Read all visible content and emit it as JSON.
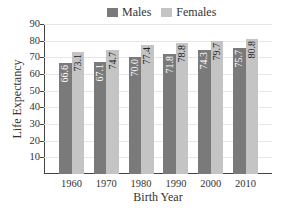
{
  "chart_data": {
    "type": "bar",
    "title": "",
    "xlabel": "Birth Year",
    "ylabel": "Life Expectancy",
    "categories": [
      "1960",
      "1970",
      "1980",
      "1990",
      "2000",
      "2010"
    ],
    "series": [
      {
        "name": "Males",
        "color": "#7a7a7a",
        "values": [
          66.6,
          67.1,
          70.0,
          71.8,
          74.3,
          75.7
        ],
        "labels": [
          "66.6",
          "67.1",
          "70.0",
          "71.8",
          "74.3",
          "75.7"
        ]
      },
      {
        "name": "Females",
        "color": "#c4c4c4",
        "values": [
          73.1,
          74.7,
          77.4,
          78.8,
          79.7,
          80.8
        ],
        "labels": [
          "73.1",
          "74.7",
          "77.4",
          "78.8",
          "79.7",
          "80.8"
        ]
      }
    ],
    "ylim": [
      0,
      90
    ],
    "yticks": [
      "10",
      "20",
      "30",
      "40",
      "50",
      "60",
      "70",
      "80",
      "90"
    ],
    "grid": true,
    "legend_position": "top"
  }
}
